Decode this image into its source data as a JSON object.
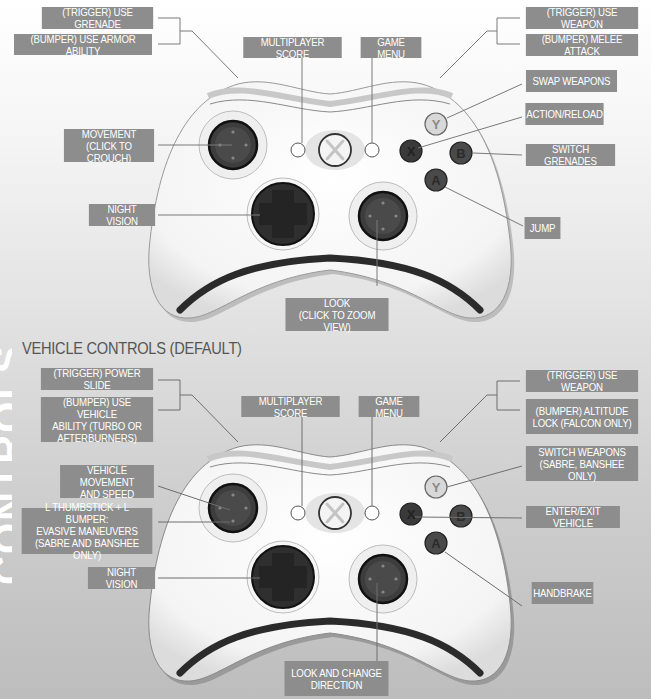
{
  "edge_text": "CONTROLS",
  "colors": {
    "label_bg": "#8d8d8d",
    "label_text": "#ffffff",
    "leader_line": "#7a7a7a",
    "controller_body": "#ffffff",
    "controller_outline": "#2b2b2b",
    "button_dark": "#3a3a3a",
    "button_y_light": "#d8d8d8"
  },
  "infantry_controls": {
    "labels": {
      "trigger_left": "(TRIGGER) USE GRENADE",
      "bumper_left": "(BUMPER) USE ARMOR ABILITY",
      "multiplayer_score": "MULTIPLAYER SCORE",
      "game_menu": "GAME MENU",
      "trigger_right": "(TRIGGER) USE WEAPON",
      "bumper_right": "(BUMPER) MELEE ATTACK",
      "y_button": "SWAP WEAPONS",
      "x_button": "ACTION/RELOAD",
      "b_button": "SWITCH GRENADES",
      "a_button": "JUMP",
      "left_stick_line1": "MOVEMENT",
      "left_stick_line2": "(CLICK TO CROUCH)",
      "dpad": "NIGHT VISION",
      "right_stick_line1": "LOOK",
      "right_stick_line2": "(CLICK TO ZOOM VIEW)"
    }
  },
  "vehicle_controls": {
    "title": "VEHICLE CONTROLS (DEFAULT)",
    "labels": {
      "trigger_left": "(TRIGGER) POWER SLIDE",
      "bumper_left_line1": "(BUMPER) USE VEHICLE",
      "bumper_left_line2": "ABILITY (TURBO OR",
      "bumper_left_line3": "AFTERBURNERS)",
      "multiplayer_score": "MULTIPLAYER SCORE",
      "game_menu": "GAME MENU",
      "trigger_right": "(TRIGGER) USE WEAPON",
      "bumper_right_line1": "(BUMPER) ALTITUDE",
      "bumper_right_line2": "LOCK (FALCON ONLY)",
      "y_button_line1": "SWITCH WEAPONS",
      "y_button_line2": "(SABRE, BANSHEE ONLY)",
      "x_b_button": "ENTER/EXIT VEHICLE",
      "a_button": "HANDBRAKE",
      "left_stick_line1": "VEHICLE MOVEMENT",
      "left_stick_line2": "AND SPEED",
      "stick_bumper_line1": "L THUMBSTICK + L BUMPER:",
      "stick_bumper_line2": "EVASIVE MANEUVERS",
      "stick_bumper_line3": "(SABRE AND BANSHEE ONLY)",
      "dpad": "NIGHT VISION",
      "right_stick_line1": "LOOK AND CHANGE",
      "right_stick_line2": "DIRECTION"
    }
  },
  "controller_buttons": {
    "y": "Y",
    "x": "X",
    "b": "B",
    "a": "A"
  }
}
